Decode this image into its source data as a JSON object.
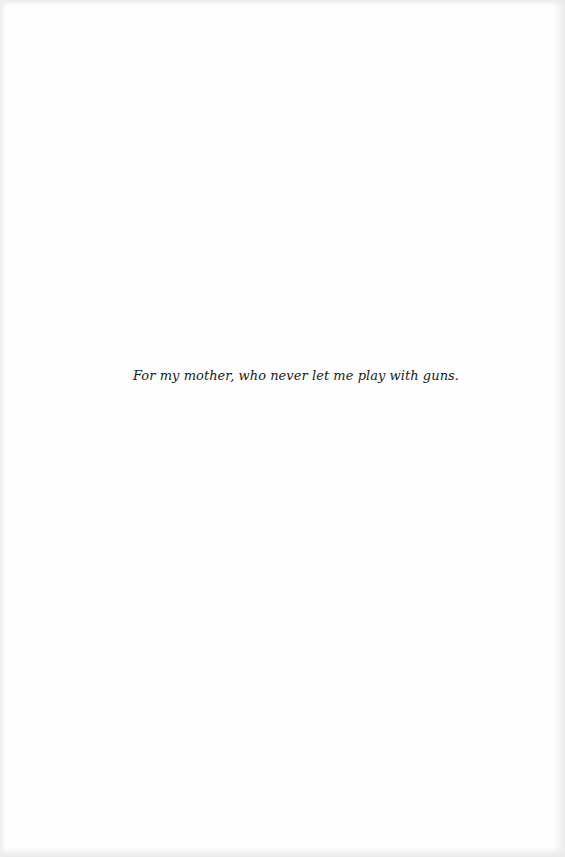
{
  "page": {
    "type": "dedication",
    "dedication_text": "For my mother, who never let me play with guns."
  },
  "colors": {
    "background": "#fefefe",
    "text": "#1a1a1a"
  }
}
